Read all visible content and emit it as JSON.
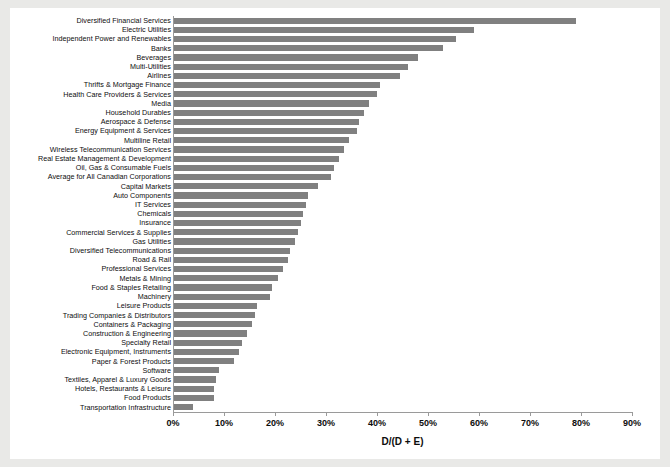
{
  "chart_data": {
    "type": "bar",
    "orientation": "horizontal",
    "title": "",
    "xlabel": "D/(D + E)",
    "ylabel": "",
    "xlim": [
      0,
      90
    ],
    "xticks": [
      "0%",
      "10%",
      "20%",
      "30%",
      "40%",
      "50%",
      "60%",
      "70%",
      "80%",
      "90%"
    ],
    "xtick_values": [
      0,
      10,
      20,
      30,
      40,
      50,
      60,
      70,
      80,
      90
    ],
    "grid": false,
    "legend": null,
    "bar_color": "#808080",
    "units": "percent",
    "categories": [
      "Diversified Financial Services",
      "Electric Utilities",
      "Independent Power and Renewables",
      "Banks",
      "Beverages",
      "Multi-Utilities",
      "Airlines",
      "Thrifts & Mortgage Finance",
      "Health Care Providers & Services",
      "Media",
      "Household Durables",
      "Aerospace & Defense",
      "Energy Equipment & Services",
      "Multiline Retail",
      "Wireless Telecommunication Services",
      "Real Estate Management & Development",
      "Oil, Gas & Consumable Fuels",
      "Average for All Canadian Corporations",
      "Capital Markets",
      "Auto Components",
      "IT Services",
      "Chemicals",
      "Insurance",
      "Commercial Services & Supplies",
      "Gas Utilities",
      "Diversified Telecommunications",
      "Road & Rail",
      "Professional Services",
      "Metals & Mining",
      "Food & Staples Retailing",
      "Machinery",
      "Leisure Products",
      "Trading Companies & Distributors",
      "Containers & Packaging",
      "Construction & Engineering",
      "Specialty Retail",
      "Electronic Equipment, Instruments",
      "Paper & Forest Products",
      "Software",
      "Textiles, Apparel & Luxury Goods",
      "Hotels, Restaurants & Leisure",
      "Food Products",
      "Transportation Infrastructure"
    ],
    "values": [
      79.0,
      59.0,
      55.5,
      53.0,
      48.0,
      46.0,
      44.5,
      40.5,
      40.0,
      38.5,
      37.5,
      36.5,
      36.0,
      34.5,
      33.5,
      32.5,
      31.5,
      31.0,
      28.5,
      26.5,
      26.0,
      25.5,
      25.0,
      24.5,
      24.0,
      23.0,
      22.5,
      21.5,
      20.5,
      19.5,
      19.0,
      16.5,
      16.0,
      15.5,
      14.5,
      13.5,
      13.0,
      12.0,
      9.0,
      8.5,
      8.0,
      8.0,
      4.0
    ]
  }
}
